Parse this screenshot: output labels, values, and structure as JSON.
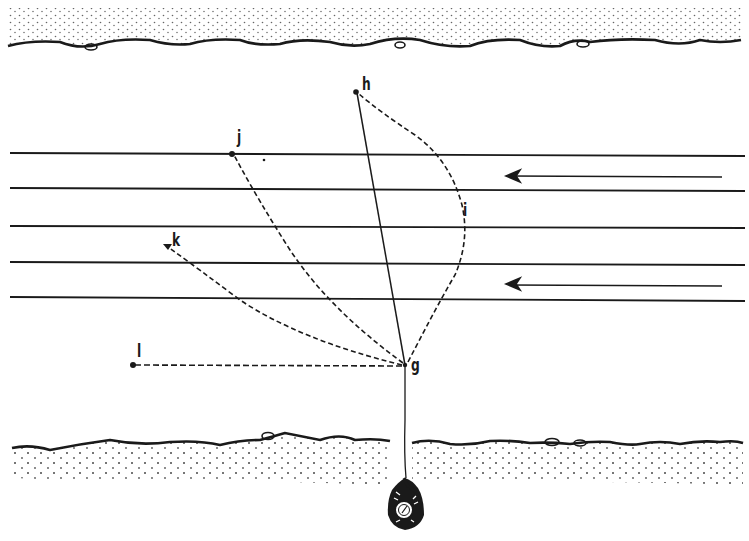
{
  "diagram": {
    "type": "river-crossing-illustration",
    "colors": {
      "ink": "#1a1a1a",
      "background": "#ffffff"
    },
    "current_direction": "right-to-left",
    "labels": {
      "g": "g",
      "h": "h",
      "i": "i",
      "j": "j",
      "k": "k",
      "l": "l"
    },
    "points": {
      "g": {
        "x": 405,
        "y": 365
      },
      "h": {
        "x": 356,
        "y": 92
      },
      "i_curve_apex": {
        "x": 462,
        "y": 225
      },
      "j": {
        "x": 233,
        "y": 154
      },
      "k": {
        "x": 166,
        "y": 245
      },
      "l": {
        "x": 132,
        "y": 365
      },
      "swimmer": {
        "x": 404,
        "y": 505
      }
    },
    "water_lines_y": [
      153,
      188,
      226,
      263,
      299
    ],
    "current_arrows": [
      {
        "y": 176,
        "x_from": 722,
        "x_to": 506
      },
      {
        "y": 284,
        "x_from": 722,
        "x_to": 506
      }
    ],
    "paths": [
      {
        "id": "g-h",
        "style": "solid",
        "from": "g",
        "to": "h"
      },
      {
        "id": "g-i-h",
        "style": "dashed",
        "from": "g",
        "to": "h",
        "via": "i"
      },
      {
        "id": "g-j",
        "style": "dashed",
        "from": "g",
        "to": "j"
      },
      {
        "id": "g-k",
        "style": "dashed",
        "from": "g",
        "to": "k"
      },
      {
        "id": "g-l",
        "style": "dashed",
        "from": "g",
        "to": "l"
      },
      {
        "id": "rope",
        "style": "solid",
        "from": "swimmer",
        "to": "g"
      }
    ],
    "banks": [
      "far-bank",
      "near-bank"
    ]
  }
}
